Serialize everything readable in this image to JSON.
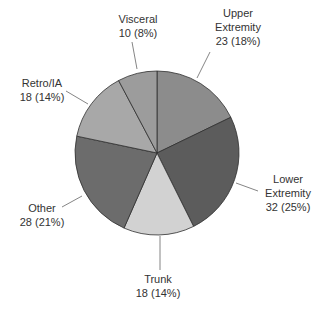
{
  "chart_data": {
    "type": "pie",
    "title": "",
    "start_angle_deg": 0,
    "direction": "clockwise",
    "categories": [
      "Upper Extremity",
      "Lower Extremity",
      "Trunk",
      "Other",
      "Retro/IA",
      "Visceral"
    ],
    "values": [
      23,
      32,
      18,
      28,
      18,
      10
    ],
    "percentages": [
      18,
      25,
      14,
      21,
      14,
      8
    ],
    "colors": [
      "#8c8c8c",
      "#5c5c5c",
      "#d2d2d2",
      "#6c6c6c",
      "#a8a8a8",
      "#9c9c9c"
    ],
    "legend": "none (direct labels with leader lines)",
    "labels": [
      {
        "lines": [
          "Upper",
          "Extremity",
          "23 (18%)"
        ]
      },
      {
        "lines": [
          "Lower",
          "Extremity",
          "32 (25%)"
        ]
      },
      {
        "lines": [
          "Trunk",
          "18 (14%)"
        ]
      },
      {
        "lines": [
          "Other",
          "28 (21%)"
        ]
      },
      {
        "lines": [
          "Retro/IA",
          "18 (14%)"
        ]
      },
      {
        "lines": [
          "Visceral",
          "10 (8%)"
        ]
      }
    ]
  },
  "layout": {
    "center": [
      157,
      153
    ],
    "radius": 82,
    "label_positions": [
      {
        "left": 208,
        "top": 6,
        "width": 60
      },
      {
        "left": 256,
        "top": 172,
        "width": 64
      },
      {
        "left": 128,
        "top": 272,
        "width": 60
      },
      {
        "left": 14,
        "top": 201,
        "width": 56
      },
      {
        "left": 14,
        "top": 76,
        "width": 56
      },
      {
        "left": 110,
        "top": 12,
        "width": 56
      }
    ],
    "leaders": [
      [
        [
          197,
          78
        ],
        [
          210,
          52
        ]
      ],
      [
        [
          236,
          183
        ],
        [
          258,
          191
        ]
      ],
      [
        [
          160,
          236
        ],
        [
          160,
          270
        ]
      ],
      [
        [
          82,
          196
        ],
        [
          62,
          207
        ]
      ],
      [
        [
          88,
          104
        ],
        [
          66,
          91
        ]
      ],
      [
        [
          137,
          69
        ],
        [
          132,
          42
        ]
      ]
    ]
  }
}
